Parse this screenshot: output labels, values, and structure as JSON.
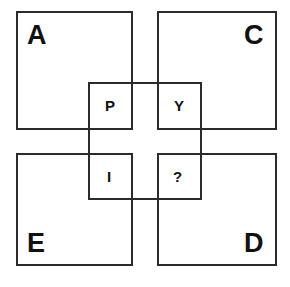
{
  "figure": {
    "stroke_color": "#2b2b2b",
    "text_color": "#111111",
    "background_color": "#ffffff",
    "width": 290,
    "height": 287
  },
  "outer_squares": [
    {
      "id": "top-left",
      "label": "A",
      "x": 16,
      "y": 11,
      "w": 117,
      "h": 119,
      "label_x": 27,
      "label_y": 22
    },
    {
      "id": "top-right",
      "label": "C",
      "x": 157,
      "y": 11,
      "w": 120,
      "h": 119,
      "label_x": 244,
      "label_y": 22
    },
    {
      "id": "bottom-left",
      "label": "E",
      "x": 16,
      "y": 153,
      "w": 117,
      "h": 113,
      "label_x": 27,
      "label_y": 230
    },
    {
      "id": "bottom-right",
      "label": "D",
      "x": 157,
      "y": 153,
      "w": 120,
      "h": 113,
      "label_x": 244,
      "label_y": 230
    }
  ],
  "center_frame": {
    "id": "center-frame",
    "x": 88,
    "y": 82,
    "w": 114,
    "h": 118
  },
  "mini_squares": [
    {
      "id": "top-left",
      "label": "P",
      "x": 88,
      "y": 82,
      "w": 45,
      "h": 48,
      "label_x": 105,
      "label_y": 98
    },
    {
      "id": "top-right",
      "label": "Y",
      "x": 157,
      "y": 82,
      "w": 45,
      "h": 48,
      "label_x": 174,
      "label_y": 98
    },
    {
      "id": "bottom-left",
      "label": "I",
      "x": 88,
      "y": 153,
      "w": 45,
      "h": 47,
      "label_x": 107,
      "label_y": 169
    },
    {
      "id": "bottom-right",
      "label": "?",
      "x": 157,
      "y": 153,
      "w": 45,
      "h": 47,
      "label_x": 173,
      "label_y": 169
    }
  ]
}
